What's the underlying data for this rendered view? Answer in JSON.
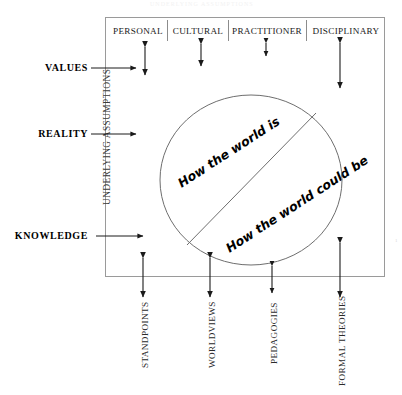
{
  "diagram": {
    "title_faint": "UNDERLYING ASSUMPTIONS",
    "circle_text": {
      "upper": "How the world is",
      "lower": "How the world could be"
    },
    "top_headers": [
      {
        "label": "PERSONAL"
      },
      {
        "label": "CULTURAL"
      },
      {
        "label": "PRACTITIONER"
      },
      {
        "label": "DISCIPLINARY"
      }
    ],
    "left_labels": [
      {
        "label": "VALUES"
      },
      {
        "label": "REALITY"
      },
      {
        "label": "KNOWLEDGE"
      }
    ],
    "left_axis_label": "UNDERLYING ASSUMPTIONS",
    "bottom_labels": [
      {
        "label": "STANDPOINTS"
      },
      {
        "label": "WORLDVIEWS"
      },
      {
        "label": "PEDAGOGIES"
      },
      {
        "label": "FORMAL THEORIES"
      }
    ],
    "corner_mark": "1",
    "colors": {
      "frame": "#9a9a9a",
      "arrow": "#1a1a1a",
      "circle": "#6e6e6e",
      "text": "#1a1a1a"
    }
  }
}
